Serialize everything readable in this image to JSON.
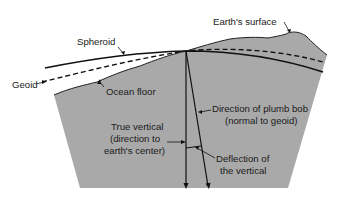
{
  "diagram": {
    "colors": {
      "earth_fill": "#a9a9a9",
      "line": "#111111",
      "background": "#ffffff"
    },
    "labels": {
      "earths_surface": "Earth's surface",
      "spheroid": "Spheroid",
      "geoid": "Geoid",
      "ocean_floor": "Ocean floor",
      "plumb_line1": "Direction of plumb bob",
      "plumb_line2": "(normal to geoid)",
      "true_vertical1": "True vertical",
      "true_vertical2": "(direction to",
      "true_vertical3": "earth's center)",
      "deflection1": "Deflection of",
      "deflection2": "the vertical"
    },
    "legend": {
      "spheroid_line": "solid",
      "geoid_line": "dashed"
    }
  }
}
